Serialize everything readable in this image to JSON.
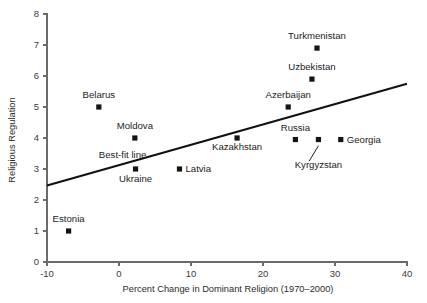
{
  "chart_data": {
    "type": "scatter",
    "title": "",
    "xlabel": "Percent Change in Dominant Religion (1970–2000)",
    "ylabel": "Religious Regulation",
    "xlim": [
      -10,
      40
    ],
    "ylim": [
      0,
      8
    ],
    "xticks": [
      -10,
      0,
      10,
      20,
      30,
      40
    ],
    "yticks": [
      0,
      1,
      2,
      3,
      4,
      5,
      6,
      7,
      8
    ],
    "xtick_labels": [
      "-10",
      "0",
      "10",
      "20",
      "30",
      "40"
    ],
    "ytick_labels": [
      "0",
      "1",
      "2",
      "3",
      "4",
      "5",
      "6",
      "7",
      "8"
    ],
    "grid": false,
    "legend": "none",
    "marker_color": "#141414",
    "line_color": "#111111",
    "axis_color": "#6b6b6b",
    "points": [
      {
        "label": "Estonia",
        "x": -7.0,
        "y": 1.0,
        "label_dx": 0,
        "label_dy": -9,
        "anchor": "middle"
      },
      {
        "label": "Belarus",
        "x": -2.8,
        "y": 5.0,
        "label_dx": 0,
        "label_dy": -9,
        "anchor": "middle"
      },
      {
        "label": "Moldova",
        "x": 2.2,
        "y": 4.0,
        "label_dx": 0,
        "label_dy": -9,
        "anchor": "middle"
      },
      {
        "label": "Ukraine",
        "x": 2.3,
        "y": 3.0,
        "label_dx": 0,
        "label_dy": 13,
        "anchor": "middle"
      },
      {
        "label": "Latvia",
        "x": 8.4,
        "y": 3.0,
        "label_dx": 6,
        "label_dy": 3,
        "anchor": "start"
      },
      {
        "label": "Kazakhstan",
        "x": 16.4,
        "y": 4.0,
        "label_dx": 0,
        "label_dy": 12,
        "anchor": "middle"
      },
      {
        "label": "Azerbaijan",
        "x": 23.5,
        "y": 5.0,
        "label_dx": 0,
        "label_dy": -9,
        "anchor": "middle"
      },
      {
        "label": "Uzbekistan",
        "x": 26.8,
        "y": 5.9,
        "label_dx": 0,
        "label_dy": -9,
        "anchor": "middle"
      },
      {
        "label": "Turkmenistan",
        "x": 27.5,
        "y": 6.9,
        "label_dx": 0,
        "label_dy": -9,
        "anchor": "middle"
      },
      {
        "label": "Russia",
        "x": 24.5,
        "y": 3.95,
        "label_dx": 0,
        "label_dy": -9,
        "anchor": "middle"
      },
      {
        "label": "Kyrgyzstan",
        "x": 27.7,
        "y": 3.95,
        "label_dx": 0,
        "label_dy": 28,
        "anchor": "middle"
      },
      {
        "label": "Georgia",
        "x": 30.8,
        "y": 3.95,
        "label_dx": 6,
        "label_dy": 3,
        "anchor": "start"
      }
    ],
    "fit_line": {
      "label": "Best-fit line",
      "x_start": -10,
      "y_start": 2.47,
      "x_end": 40,
      "y_end": 5.75,
      "label_x": 0.5,
      "label_y": 3.35
    },
    "leader": {
      "from_x": 27.7,
      "from_y": 3.75,
      "to_x": 26.4,
      "to_y": 3.25
    }
  }
}
